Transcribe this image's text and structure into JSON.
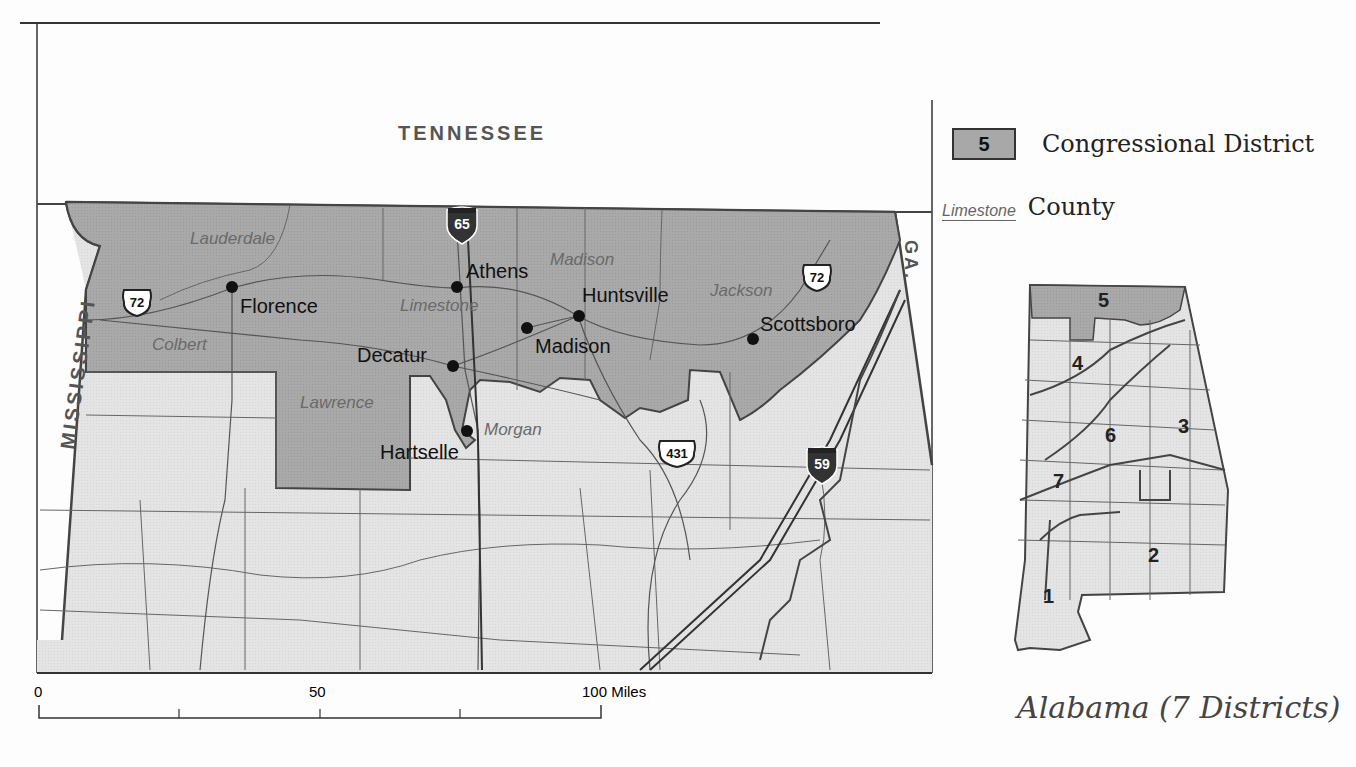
{
  "map": {
    "neighbors": {
      "north": "TENNESSEE",
      "west": "MISSISSIPPI",
      "east": "GA."
    },
    "district_label_color": "#a8a8a8",
    "background_fill": "#e6e6e6",
    "counties_in_district": [
      {
        "name": "Lauderdale"
      },
      {
        "name": "Colbert"
      },
      {
        "name": "Limestone"
      },
      {
        "name": "Madison"
      },
      {
        "name": "Jackson"
      },
      {
        "name": "Lawrence"
      },
      {
        "name": "Morgan"
      }
    ],
    "cities": [
      {
        "name": "Florence"
      },
      {
        "name": "Athens"
      },
      {
        "name": "Huntsville"
      },
      {
        "name": "Madison"
      },
      {
        "name": "Decatur"
      },
      {
        "name": "Scottsboro"
      },
      {
        "name": "Hartselle"
      }
    ],
    "highways": [
      {
        "type": "interstate",
        "number": "65"
      },
      {
        "type": "interstate",
        "number": "59"
      },
      {
        "type": "us-route",
        "number": "72"
      },
      {
        "type": "us-route",
        "number": "72"
      },
      {
        "type": "us-route",
        "number": "431"
      }
    ]
  },
  "scale_bar": {
    "ticks": [
      "0",
      "50",
      "100 Miles"
    ]
  },
  "legend": {
    "district_number": "5",
    "district_label": "Congressional District",
    "county_sample": "Limestone",
    "county_label": "County"
  },
  "inset": {
    "title": "Alabama (7 Districts)",
    "districts": [
      "1",
      "2",
      "3",
      "4",
      "5",
      "6",
      "7"
    ],
    "highlighted_district": "5"
  }
}
